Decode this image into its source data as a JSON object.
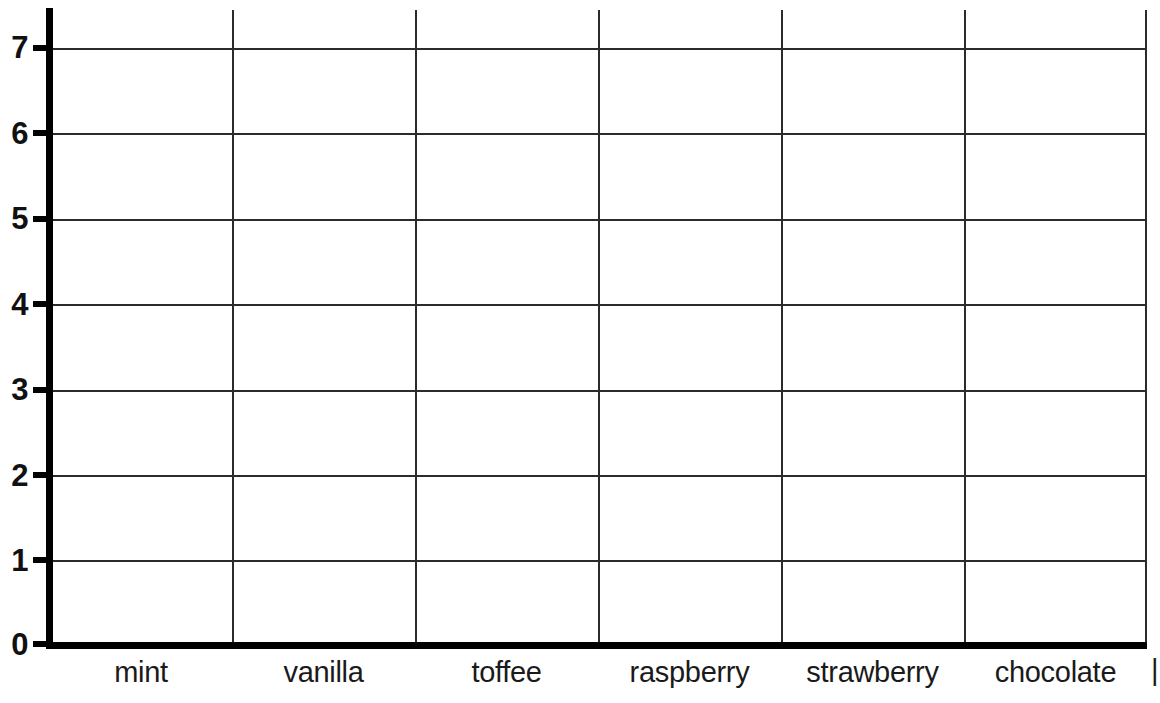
{
  "chart_data": {
    "type": "bar",
    "title": "",
    "subtitle": "",
    "xlabel": "",
    "ylabel": "",
    "categories": [
      "mint",
      "vanilla",
      "toffee",
      "raspberry",
      "strawberry",
      "chocolate"
    ],
    "values": [
      null,
      null,
      null,
      null,
      null,
      null
    ],
    "series": [
      {
        "name": "",
        "values": [
          null,
          null,
          null,
          null,
          null,
          null
        ]
      }
    ],
    "ylim": [
      0,
      7
    ],
    "y_ticks": [
      "0",
      "1",
      "2",
      "3",
      "4",
      "5",
      "6",
      "7"
    ],
    "y_tick_values": [
      0,
      1,
      2,
      3,
      4,
      5,
      6,
      7
    ],
    "y_tick_interval": 1,
    "grid": true,
    "grid_x": true,
    "grid_y": true,
    "legend": false,
    "legend_position": "none",
    "blank_template": true
  },
  "axes": {
    "y_axis": {
      "name": "y-axis",
      "ticks": [
        {
          "label": "7",
          "value": 7
        },
        {
          "label": "6",
          "value": 6
        },
        {
          "label": "5",
          "value": 5
        },
        {
          "label": "4",
          "value": 4
        },
        {
          "label": "3",
          "value": 3
        },
        {
          "label": "2",
          "value": 2
        },
        {
          "label": "1",
          "value": 1
        },
        {
          "label": "0",
          "value": 0
        }
      ]
    },
    "x_axis": {
      "name": "x-axis",
      "categories": [
        {
          "label": "mint"
        },
        {
          "label": "vanilla"
        },
        {
          "label": "toffee"
        },
        {
          "label": "raspberry"
        },
        {
          "label": "strawberry"
        },
        {
          "label": "chocolate"
        }
      ]
    }
  },
  "clipped": {
    "top_fragment": "",
    "right_fragment": "|"
  },
  "colors": {
    "background": "#ffffff",
    "axis": "#000000",
    "grid": "#2b2b2b",
    "text": "#1a1a1a"
  }
}
